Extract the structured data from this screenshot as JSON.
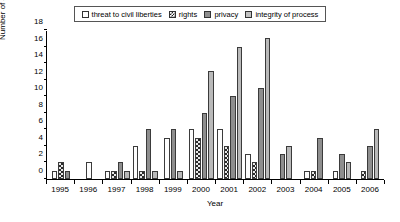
{
  "chart_data": {
    "type": "bar",
    "title": "",
    "xlabel": "Year",
    "ylabel": "Number of articles",
    "categories": [
      "1995",
      "1996",
      "1997",
      "1998",
      "1999",
      "2000",
      "2001",
      "2002",
      "2003",
      "2004",
      "2005",
      "2006"
    ],
    "ylim": [
      0,
      18
    ],
    "yticks": [
      0,
      2,
      4,
      6,
      8,
      10,
      12,
      14,
      16,
      18
    ],
    "grid": false,
    "legend_position": "top",
    "series": [
      {
        "name": "threat to civil liberties",
        "color": "#ffffff",
        "pattern": "open",
        "values": [
          1,
          2,
          1,
          4,
          5,
          6,
          6,
          3,
          0,
          1,
          1,
          0
        ]
      },
      {
        "name": "rights",
        "color": "#222222",
        "pattern": "checkerboard",
        "values": [
          2,
          0,
          1,
          1,
          0,
          5,
          4,
          2,
          0,
          1,
          0,
          1
        ]
      },
      {
        "name": "privacy",
        "color": "#8e8e8e",
        "pattern": "solid-dark-gray",
        "values": [
          1,
          0,
          2,
          6,
          6,
          8,
          10,
          11,
          3,
          5,
          3,
          4
        ]
      },
      {
        "name": "integrity of process",
        "color": "#b9b9b9",
        "pattern": "solid-light-gray",
        "values": [
          0,
          0,
          1,
          1,
          1,
          13,
          16,
          17,
          4,
          0,
          2,
          6
        ]
      }
    ]
  },
  "legend": {
    "items": [
      {
        "label": "threat to civil liberties",
        "swatch": "open-square-icon"
      },
      {
        "label": "rights",
        "swatch": "checkered-square-icon"
      },
      {
        "label": "privacy",
        "swatch": "dark-gray-square-icon"
      },
      {
        "label": "integrity of process",
        "swatch": "light-gray-square-icon"
      }
    ]
  },
  "axes": {
    "y_title": "Number of articles",
    "x_title": "Year",
    "y_tick_labels": [
      "0",
      "2",
      "4",
      "6",
      "8",
      "10",
      "12",
      "14",
      "16",
      "18"
    ],
    "x_tick_labels": [
      "1995",
      "1996",
      "1997",
      "1998",
      "1999",
      "2000",
      "2001",
      "2002",
      "2003",
      "2004",
      "2005",
      "2006"
    ]
  }
}
